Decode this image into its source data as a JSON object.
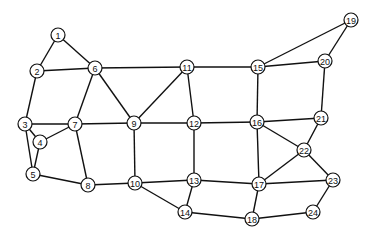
{
  "graph": {
    "node_radius": 7,
    "colors": {
      "edge": "#111111",
      "node_fill": "#ffffff",
      "node_stroke": "#111111"
    },
    "nodes": [
      {
        "id": "1",
        "x": 58,
        "y": 35
      },
      {
        "id": "2",
        "x": 37,
        "y": 71
      },
      {
        "id": "3",
        "x": 25,
        "y": 124
      },
      {
        "id": "4",
        "x": 40,
        "y": 142
      },
      {
        "id": "5",
        "x": 33,
        "y": 174
      },
      {
        "id": "6",
        "x": 95,
        "y": 68
      },
      {
        "id": "7",
        "x": 75,
        "y": 124
      },
      {
        "id": "8",
        "x": 88,
        "y": 185
      },
      {
        "id": "9",
        "x": 134,
        "y": 123
      },
      {
        "id": "10",
        "x": 135,
        "y": 183
      },
      {
        "id": "11",
        "x": 187,
        "y": 67
      },
      {
        "id": "12",
        "x": 194,
        "y": 123
      },
      {
        "id": "13",
        "x": 194,
        "y": 180
      },
      {
        "id": "14",
        "x": 185,
        "y": 212
      },
      {
        "id": "15",
        "x": 258,
        "y": 67
      },
      {
        "id": "16",
        "x": 257,
        "y": 122
      },
      {
        "id": "17",
        "x": 259,
        "y": 184
      },
      {
        "id": "18",
        "x": 252,
        "y": 219
      },
      {
        "id": "19",
        "x": 351,
        "y": 20
      },
      {
        "id": "20",
        "x": 325,
        "y": 61
      },
      {
        "id": "21",
        "x": 321,
        "y": 118
      },
      {
        "id": "22",
        "x": 304,
        "y": 150
      },
      {
        "id": "23",
        "x": 333,
        "y": 180
      },
      {
        "id": "24",
        "x": 313,
        "y": 212
      }
    ],
    "edges": [
      [
        "1",
        "2"
      ],
      [
        "1",
        "6"
      ],
      [
        "2",
        "6"
      ],
      [
        "2",
        "3"
      ],
      [
        "3",
        "7"
      ],
      [
        "3",
        "4"
      ],
      [
        "3",
        "5"
      ],
      [
        "4",
        "7"
      ],
      [
        "4",
        "5"
      ],
      [
        "5",
        "8"
      ],
      [
        "6",
        "7"
      ],
      [
        "6",
        "9"
      ],
      [
        "6",
        "11"
      ],
      [
        "7",
        "8"
      ],
      [
        "7",
        "9"
      ],
      [
        "8",
        "10"
      ],
      [
        "9",
        "11"
      ],
      [
        "9",
        "12"
      ],
      [
        "9",
        "10"
      ],
      [
        "10",
        "13"
      ],
      [
        "10",
        "14"
      ],
      [
        "11",
        "12"
      ],
      [
        "11",
        "15"
      ],
      [
        "12",
        "16"
      ],
      [
        "12",
        "13"
      ],
      [
        "13",
        "17"
      ],
      [
        "13",
        "14"
      ],
      [
        "14",
        "18"
      ],
      [
        "15",
        "16"
      ],
      [
        "15",
        "19"
      ],
      [
        "15",
        "20"
      ],
      [
        "19",
        "20"
      ],
      [
        "20",
        "21"
      ],
      [
        "16",
        "21"
      ],
      [
        "16",
        "22"
      ],
      [
        "16",
        "17"
      ],
      [
        "21",
        "22"
      ],
      [
        "22",
        "17"
      ],
      [
        "22",
        "23"
      ],
      [
        "17",
        "23"
      ],
      [
        "17",
        "18"
      ],
      [
        "18",
        "24"
      ],
      [
        "23",
        "24"
      ]
    ]
  }
}
